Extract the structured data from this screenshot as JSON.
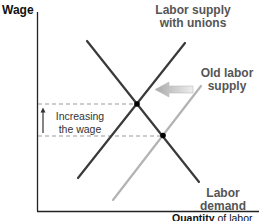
{
  "diagram": {
    "type": "labor market supply and demand",
    "axes": {
      "y_label": "Wage",
      "x_label_bold": "Quantity",
      "x_label_rest": " of labor"
    },
    "curves": [
      {
        "name": "Labor supply with unions",
        "line1": "Labor supply",
        "line2": "with unions",
        "color": "#3a3a3a"
      },
      {
        "name": "Old labor supply",
        "line1": "Old labor",
        "line2": "supply",
        "color": "#b0b0b0"
      },
      {
        "name": "Labor demand",
        "line1": "Labor",
        "line2": "demand",
        "color": "#3a3a3a"
      }
    ],
    "annotation": {
      "line1": "Increasing",
      "line2": "the wage"
    },
    "shift_arrow": {
      "direction": "left",
      "color": "#c8c8c8"
    },
    "label_color": "#555555"
  }
}
